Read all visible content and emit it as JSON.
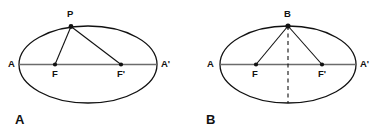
{
  "figure": {
    "background_color": "#ffffff",
    "stroke_color": "#111111",
    "axis_color": "#6b6b6b",
    "width": 381,
    "height": 136
  },
  "panels": [
    {
      "id": "panel-a",
      "panel_label": "A",
      "panel_label_x": 15,
      "panel_label_y": 124,
      "ellipse": {
        "cx": 88,
        "cy": 64.5,
        "rx": 69,
        "ry": 38.5
      },
      "major_axis": {
        "x1": 19,
        "y1": 64.5,
        "x2": 157,
        "y2": 64.5
      },
      "points": [
        {
          "name": "A",
          "label": "A",
          "x": 19,
          "y": 64.5,
          "label_x": 8,
          "label_y": 67,
          "dot": false
        },
        {
          "name": "A-prime",
          "label": "A'",
          "x": 157,
          "y": 64.5,
          "label_x": 161,
          "label_y": 67,
          "dot": false
        },
        {
          "name": "F",
          "label": "F",
          "x": 55,
          "y": 64.5,
          "label_x": 52,
          "label_y": 77,
          "dot": true
        },
        {
          "name": "F-prime",
          "label": "F'",
          "x": 121,
          "y": 64.5,
          "label_x": 117,
          "label_y": 77,
          "dot": true
        },
        {
          "name": "P",
          "label": "P",
          "x": 71,
          "y": 26.5,
          "label_x": 67,
          "label_y": 17,
          "dot": true
        }
      ],
      "focal_radii": [
        {
          "name": "segment-P-F",
          "x1": 71,
          "y1": 26.5,
          "x2": 55,
          "y2": 64.5
        },
        {
          "name": "segment-P-Fprime",
          "x1": 71,
          "y1": 26.5,
          "x2": 121,
          "y2": 64.5
        }
      ],
      "dashed_axis": null
    },
    {
      "id": "panel-b",
      "panel_label": "B",
      "panel_label_x": 206,
      "panel_label_y": 124,
      "ellipse": {
        "cx": 288,
        "cy": 64.5,
        "rx": 68,
        "ry": 38.5
      },
      "major_axis": {
        "x1": 220,
        "y1": 64.5,
        "x2": 356,
        "y2": 64.5
      },
      "points": [
        {
          "name": "A",
          "label": "A",
          "x": 220,
          "y": 64.5,
          "label_x": 207,
          "label_y": 67,
          "dot": false
        },
        {
          "name": "A-prime",
          "label": "A'",
          "x": 356,
          "y": 64.5,
          "label_x": 360,
          "label_y": 67,
          "dot": false
        },
        {
          "name": "F",
          "label": "F",
          "x": 256,
          "y": 64.5,
          "label_x": 252,
          "label_y": 77,
          "dot": true
        },
        {
          "name": "F-prime",
          "label": "F'",
          "x": 322,
          "y": 64.5,
          "label_x": 318,
          "label_y": 77,
          "dot": true
        },
        {
          "name": "B",
          "label": "B",
          "x": 288,
          "y": 26,
          "label_x": 284,
          "label_y": 17,
          "dot": true
        }
      ],
      "focal_radii": [
        {
          "name": "segment-B-F",
          "x1": 288,
          "y1": 26,
          "x2": 256,
          "y2": 64.5
        },
        {
          "name": "segment-B-Fprime",
          "x1": 288,
          "y1": 26,
          "x2": 322,
          "y2": 64.5
        }
      ],
      "dashed_axis": {
        "name": "minor-axis-dashed",
        "x1": 288,
        "y1": 26,
        "x2": 288,
        "y2": 103
      }
    }
  ]
}
